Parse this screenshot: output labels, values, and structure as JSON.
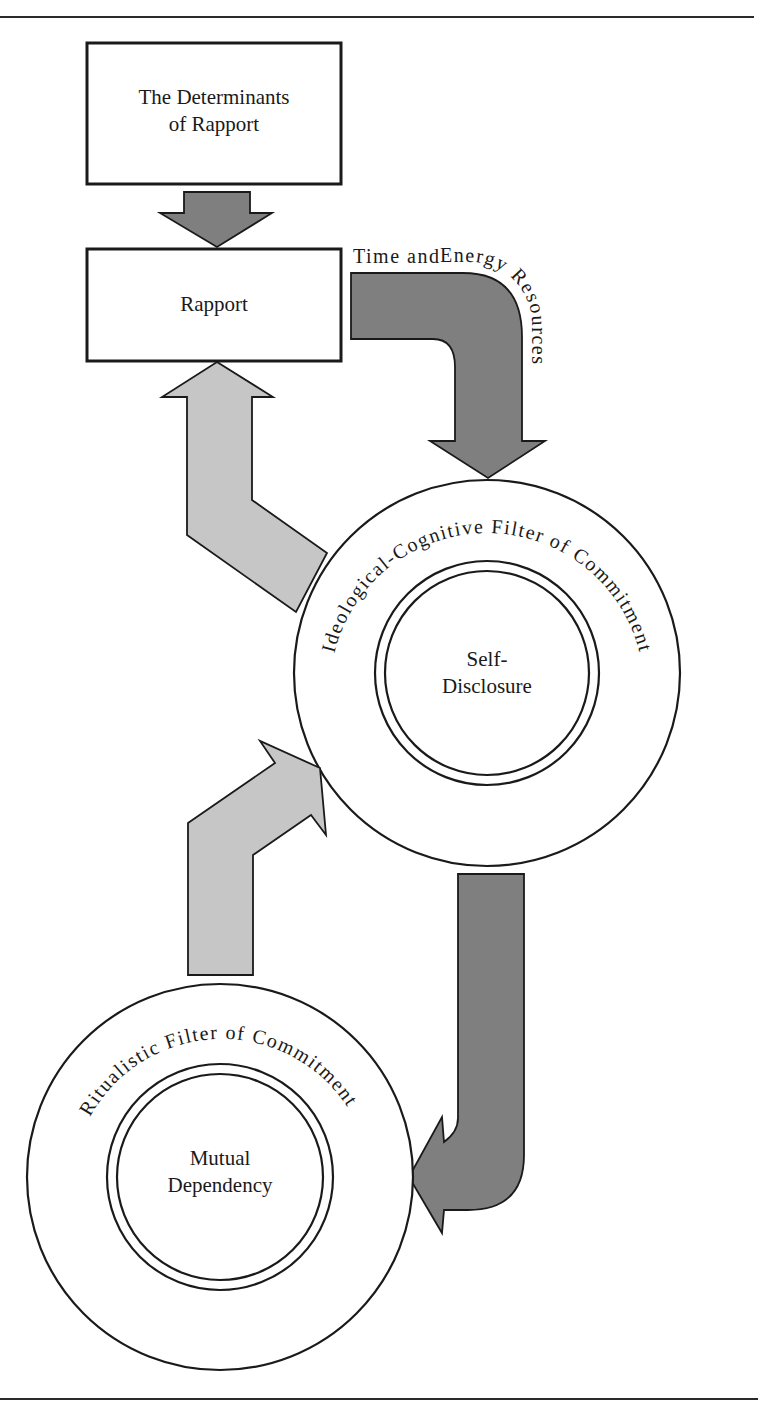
{
  "diagram": {
    "nodes": {
      "determinants": {
        "line1": "The Determinants",
        "line2": "of Rapport"
      },
      "rapport": {
        "label": "Rapport"
      },
      "ideological_filter": {
        "ring_label": "Ideological-Cognitive Filter of Commitment",
        "core_line1": "Self-",
        "core_line2": "Disclosure"
      },
      "ritualistic_filter": {
        "ring_label": "Ritualistic Filter of Commitment",
        "core_line1": "Mutual",
        "core_line2": "Dependency"
      }
    },
    "edges": [
      {
        "from": "The Determinants of Rapport",
        "to": "Rapport",
        "style": "dark"
      },
      {
        "from": "Rapport",
        "to": "Self-Disclosure",
        "style": "dark",
        "label": "Time and Energy Resources"
      },
      {
        "from": "Self-Disclosure",
        "to": "Rapport",
        "style": "light"
      },
      {
        "from": "Self-Disclosure",
        "to": "Mutual Dependency",
        "style": "dark"
      },
      {
        "from": "Mutual Dependency",
        "to": "Self-Disclosure",
        "style": "light"
      }
    ],
    "edge_labels": {
      "time_part1": "Time and ",
      "time_part2": "Energy Resources"
    },
    "colors": {
      "dark_arrow": "#7f7f7f",
      "light_arrow": "#c6c6c6",
      "stroke": "#1a1a1a"
    }
  }
}
